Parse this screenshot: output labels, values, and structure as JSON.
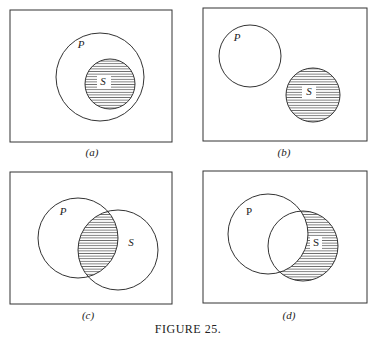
{
  "figure_caption": "FIGURE 25.",
  "panels": [
    {
      "id": "a",
      "caption": "(a)",
      "p_label": "P",
      "s_label": "S",
      "description": "S entirely inside P; S shaded"
    },
    {
      "id": "b",
      "caption": "(b)",
      "p_label": "P",
      "s_label": "S",
      "description": "P and S disjoint; S shaded"
    },
    {
      "id": "c",
      "caption": "(c)",
      "p_label": "P",
      "s_label": "S",
      "description": "P and S overlap; intersection shaded"
    },
    {
      "id": "d",
      "caption": "(d)",
      "p_label": "P",
      "s_label": "S",
      "description": "P and S overlap; S minus P shaded"
    }
  ],
  "colors": {
    "stroke": "#333333",
    "hatch": "#555555",
    "background": "#ffffff"
  }
}
